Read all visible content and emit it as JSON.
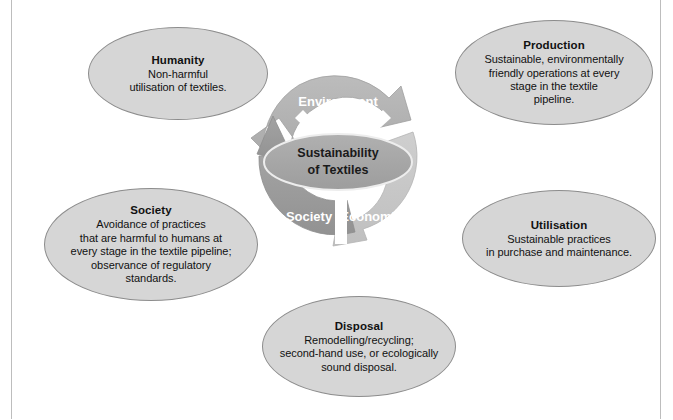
{
  "diagram": {
    "title": "Sustainability of Textiles",
    "core": {
      "line1": "Sustainability",
      "line2": "of Textiles"
    },
    "segments": [
      {
        "id": "environment",
        "label": "Environment",
        "color": "#b4b4b4"
      },
      {
        "id": "economics",
        "label": "Economics",
        "color": "#c6c6c6"
      },
      {
        "id": "society",
        "label": "Society",
        "color": "#9b9b9b"
      }
    ],
    "bubbles": [
      {
        "id": "humanity",
        "title": "Humanity",
        "body": "Non-harmful\nutilisation of textiles."
      },
      {
        "id": "production",
        "title": "Production",
        "body": "Sustainable, environmentally\nfriendly operations at every\nstage in the textile\npipeline."
      },
      {
        "id": "society",
        "title": "Society",
        "body": "Avoidance of practices\nthat are harmful to humans at\nevery stage in the textile pipeline;\nobservance of regulatory\nstandards."
      },
      {
        "id": "utilisation",
        "title": "Utilisation",
        "body": "Sustainable practices\nin purchase and maintenance."
      },
      {
        "id": "disposal",
        "title": "Disposal",
        "body": "Remodelling/recycling;\nsecond-hand use, or ecologically\nsound disposal."
      }
    ],
    "colors": {
      "bubble_fill": "#d6d6d6",
      "bubble_stroke": "#8c8c8c",
      "core_fill": "#a8a8a8",
      "core_stroke": "#eeeeee",
      "background": "#ffffff",
      "frame": "#bdbdbd"
    }
  }
}
